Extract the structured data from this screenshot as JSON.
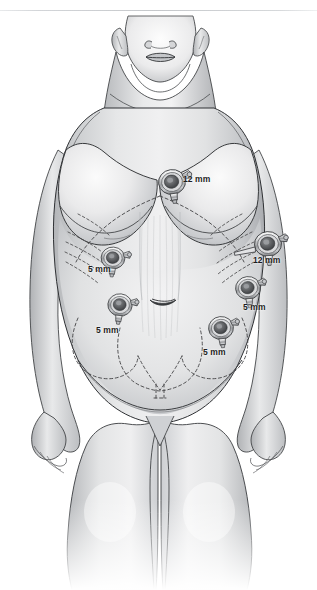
{
  "figure": {
    "background_color": "#ffffff",
    "ink_color": "#2b2b2b",
    "skin_light": "#f4f4f5",
    "skin_mid": "#d5d6d8",
    "skin_shadow": "#a9abae",
    "dashed_landmark_color": "#4a4a4c",
    "top_rule_color": "#c9ccd0"
  },
  "ports": [
    {
      "id": "subxiphoid-camera-port",
      "name": "port-12mm-subxiphoid",
      "size_label": "12 mm",
      "size_mm": 12,
      "x": 172,
      "y": 182,
      "label_x": 183,
      "label_y": 175,
      "rotation": -8,
      "scale": 1.0,
      "has_obturator": false
    },
    {
      "id": "left-upper-quadrant-port",
      "name": "port-5mm-left-upper",
      "size_label": "5 mm",
      "size_mm": 5,
      "x": 113,
      "y": 258,
      "label_x": 88,
      "label_y": 265,
      "rotation": 4,
      "scale": 0.88,
      "has_obturator": false
    },
    {
      "id": "right-upper-quadrant-port",
      "name": "port-12mm-right-upper",
      "size_label": "12 mm",
      "size_mm": 12,
      "x": 268,
      "y": 244,
      "label_x": 253,
      "label_y": 256,
      "rotation": -4,
      "scale": 1.0,
      "has_obturator": true
    },
    {
      "id": "left-lower-quadrant-port",
      "name": "port-5mm-left-lower",
      "size_label": "5 mm",
      "size_mm": 5,
      "x": 120,
      "y": 305,
      "label_x": 96,
      "label_y": 326,
      "rotation": 6,
      "scale": 0.9,
      "has_obturator": false
    },
    {
      "id": "right-flank-port",
      "name": "port-5mm-right-flank",
      "size_label": "5 mm",
      "size_mm": 5,
      "x": 248,
      "y": 288,
      "label_x": 243,
      "label_y": 303,
      "rotation": -6,
      "scale": 0.92,
      "has_obturator": false
    },
    {
      "id": "right-lower-quadrant-port",
      "name": "port-5mm-right-lower",
      "size_label": "5 mm",
      "size_mm": 5,
      "x": 221,
      "y": 328,
      "label_x": 203,
      "label_y": 348,
      "rotation": -6,
      "scale": 0.92,
      "has_obturator": false
    }
  ]
}
